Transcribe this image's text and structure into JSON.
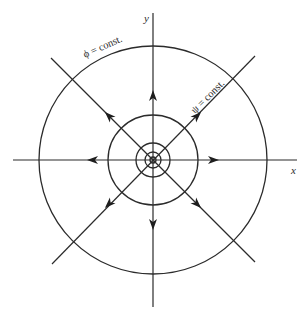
{
  "figure": {
    "center": [
      153,
      160
    ],
    "axes": {
      "x_label": "x",
      "y_label": "y"
    },
    "equipotential_label": "ϕ = const.",
    "streamline_label": "ψ = const.",
    "circle_radii": [
      3,
      8,
      17,
      45,
      114
    ],
    "streamline_directions": [
      "east",
      "northeast",
      "north",
      "northwest",
      "west",
      "southwest",
      "south",
      "southeast"
    ],
    "flow_type": "source",
    "colors": {
      "stroke": "#2b2b2b",
      "background": "#ffffff"
    }
  }
}
